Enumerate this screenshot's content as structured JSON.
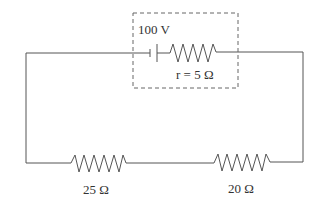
{
  "diagram": {
    "type": "circuit",
    "source": {
      "label": "100 V",
      "internal_resistance_label": "r = 5 Ω"
    },
    "resistors": [
      {
        "label": "25 Ω"
      },
      {
        "label": "20 Ω"
      }
    ]
  }
}
